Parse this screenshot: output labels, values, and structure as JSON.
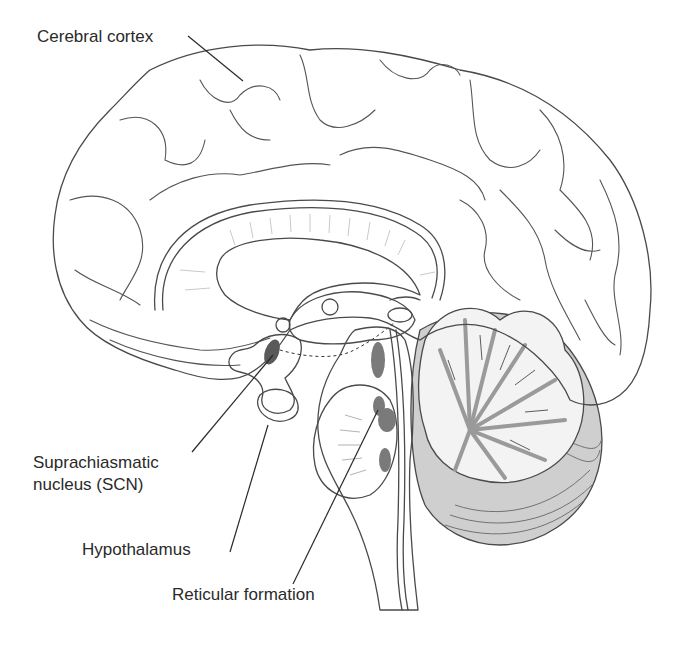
{
  "figure": {
    "type": "mid-sagittal brain anatomy illustration",
    "colors": {
      "cortex_fill": "#ececec",
      "outline": "#4a4a4a",
      "deep_structure_fill": "#c8c8c8",
      "brainstem_fill": "#bdbdbd",
      "nucleus_fill": "#8a8a8a",
      "cerebellum_white": "#f3f3f3",
      "cerebellum_arbor": "#9a9a9a",
      "label_text": "#2a2a2a"
    }
  },
  "labels": {
    "cerebral_cortex": "Cerebral cortex",
    "scn_line1": "Suprachiasmatic",
    "scn_line2": "nucleus (SCN)",
    "hypothalamus": "Hypothalamus",
    "reticular_formation": "Reticular formation"
  }
}
